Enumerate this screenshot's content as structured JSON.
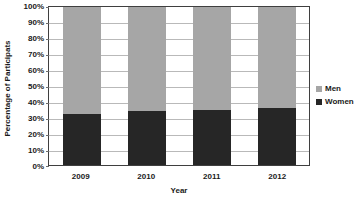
{
  "chart_data": {
    "type": "bar",
    "subtype": "stacked-100-percent",
    "title": "",
    "xlabel": "Year",
    "ylabel": "Percentage of Participats",
    "categories": [
      "2009",
      "2010",
      "2011",
      "2012"
    ],
    "series": [
      {
        "name": "Women",
        "values": [
          32,
          34,
          35,
          36
        ],
        "color": "#262626",
        "stack_position": "bottom"
      },
      {
        "name": "Men",
        "values": [
          68,
          66,
          65,
          64
        ],
        "color": "#a6a6a6",
        "stack_position": "top"
      }
    ],
    "ylim": [
      0,
      100
    ],
    "y_tick_labels": [
      "0%",
      "10%",
      "20%",
      "30%",
      "40%",
      "50%",
      "60%",
      "70%",
      "80%",
      "90%",
      "100%"
    ],
    "y_tick_values": [
      0,
      10,
      20,
      30,
      40,
      50,
      60,
      70,
      80,
      90,
      100
    ],
    "grid": "horizontal",
    "legend_position": "right",
    "legend_entries": [
      "Men",
      "Women"
    ],
    "plot_border_color": "#3f3f3f",
    "gridline_color": "#b9b9b9",
    "background": "#ffffff"
  }
}
